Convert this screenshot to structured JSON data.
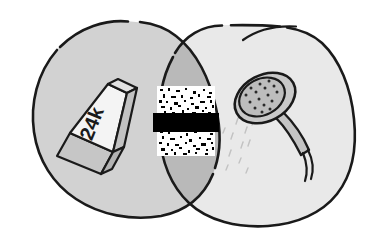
{
  "image": {
    "title": "Venn diagram rebus illustration",
    "style": "hand-drawn black ink outline with gray fills",
    "background_color": "#ffffff",
    "outline_color": "#1a1a1a",
    "width": 367,
    "height": 237
  },
  "venn": {
    "left_set": {
      "name": "left-blob",
      "fill_color": "#d2d2d2",
      "contents_label": "gold-bar"
    },
    "right_set": {
      "name": "right-blob",
      "fill_color": "#e9e9e9",
      "contents_label": "shower-head"
    },
    "intersection": {
      "name": "intersection-lens",
      "fill_color": "#b9b9b9",
      "contents_label": "censored-block"
    }
  },
  "gold_bar": {
    "label": "24k",
    "top_face_color": "#f2f2f2",
    "front_face_color": "#d6d6d6",
    "end_face_color": "#bdbdbd",
    "text_color": "#1a1a1a"
  },
  "censored_block": {
    "noise_background": "#ffffff",
    "noise_speckle_color": "#000000",
    "redaction_bar_color": "#000000",
    "redaction_bar_label": "",
    "description": "static noise square with black redaction bar across the middle"
  },
  "shower_head": {
    "head_fill_color": "#c9c9c9",
    "face_fill_color": "#bdbdbd",
    "handle_fill_color": "#c4c4c4",
    "nozzle_dot_color": "#2a2a2a",
    "hose_color": "#1a1a1a",
    "droplet_color": "#c9c9c9",
    "nozzle_count": 16
  },
  "icons": {
    "gold_bar": "gold-bar-icon",
    "censored": "censored-block-icon",
    "shower": "shower-head-icon",
    "droplets": "water-droplets-icon"
  }
}
